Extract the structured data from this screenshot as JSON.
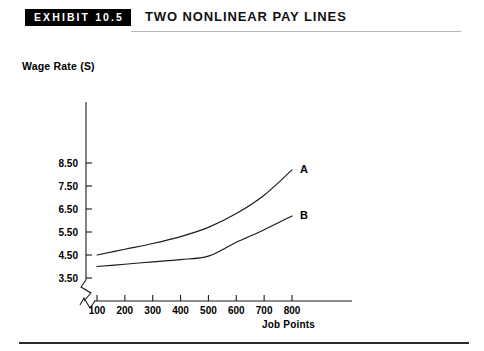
{
  "header": {
    "badge_label": "EXHIBIT 10.5",
    "title": "TWO NONLINEAR PAY LINES"
  },
  "chart_data": {
    "type": "line",
    "title": "Two Nonlinear Pay Lines",
    "xlabel": "Job Points",
    "ylabel": "Wage Rate (S)",
    "xlim": [
      0,
      850
    ],
    "ylim": [
      3.0,
      9.0
    ],
    "xticks": [
      100,
      200,
      300,
      400,
      500,
      600,
      700,
      800
    ],
    "xtick_labels": [
      "100",
      "200",
      "300",
      "400",
      "500",
      "600",
      "700",
      "800"
    ],
    "yticks": [
      3.5,
      4.5,
      5.5,
      6.5,
      7.5,
      8.5
    ],
    "ytick_labels": [
      "3.50",
      "4.50",
      "5.50",
      "6.50",
      "7.50",
      "8.50"
    ],
    "grid": false,
    "legend": "inline-end-labels",
    "axis_break": true,
    "series": [
      {
        "name": "A",
        "label": "A",
        "color": "#1a1a1a",
        "x": [
          100,
          200,
          300,
          400,
          500,
          600,
          700,
          800
        ],
        "values": [
          4.5,
          4.75,
          5.0,
          5.3,
          5.7,
          6.3,
          7.1,
          8.2
        ]
      },
      {
        "name": "B",
        "label": "B",
        "color": "#1a1a1a",
        "x": [
          100,
          200,
          300,
          400,
          500,
          600,
          700,
          800
        ],
        "values": [
          4.0,
          4.1,
          4.2,
          4.3,
          4.45,
          5.05,
          5.6,
          6.2
        ]
      }
    ]
  }
}
